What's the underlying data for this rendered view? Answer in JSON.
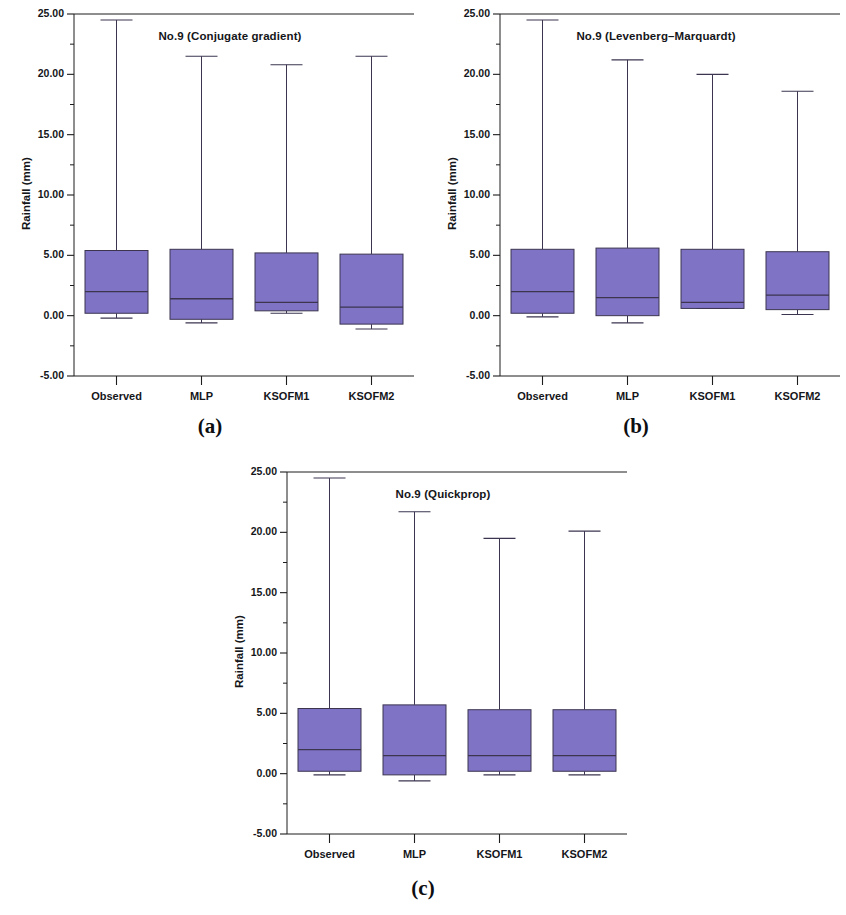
{
  "figure": {
    "panels": [
      {
        "id": "a",
        "caption": "(a)",
        "title": "No.9 (Conjugate gradient)",
        "ylabel": "Rainfall (mm)"
      },
      {
        "id": "b",
        "caption": "(b)",
        "title": "No.9 (Levenberg–Marquardt)",
        "ylabel": "Rainfall (mm)"
      },
      {
        "id": "c",
        "caption": "(c)",
        "title": "No.9 (Quickprop)",
        "ylabel": "Rainfall (mm)"
      }
    ]
  },
  "axis": {
    "ytick_labels": [
      "25.00",
      "20.00",
      "15.00",
      "10.00",
      "5.00",
      "0.00",
      "-5.00"
    ],
    "xtick_labels": [
      "Observed",
      "MLP",
      "KSOFM1",
      "KSOFM2"
    ]
  },
  "colors": {
    "box_fill": "#7f73c6",
    "box_edge": "#3d3550",
    "axis": "#1c1c1c",
    "text": "#15161a",
    "background": "#ffffff"
  },
  "chart_data": [
    {
      "type": "box",
      "panel": "a",
      "title": "No.9 (Conjugate gradient)",
      "xlabel": "",
      "ylabel": "Rainfall (mm)",
      "ylim": [
        -5.0,
        25.0
      ],
      "ytick_values": [
        25.0,
        20.0,
        15.0,
        10.0,
        5.0,
        0.0,
        -5.0
      ],
      "minor_tick_step": 2.5,
      "grid": false,
      "legend": "none",
      "categories": [
        "Observed",
        "MLP",
        "KSOFM1",
        "KSOFM2"
      ],
      "boxes": [
        {
          "category": "Observed",
          "whisker_low": -0.2,
          "q1": 0.2,
          "median": 2.0,
          "q3": 5.4,
          "whisker_high": 24.5
        },
        {
          "category": "MLP",
          "whisker_low": -0.6,
          "q1": -0.3,
          "median": 1.4,
          "q3": 5.5,
          "whisker_high": 21.5
        },
        {
          "category": "KSOFM1",
          "whisker_low": 0.2,
          "q1": 0.4,
          "median": 1.1,
          "q3": 5.2,
          "whisker_high": 20.8
        },
        {
          "category": "KSOFM2",
          "whisker_low": -1.1,
          "q1": -0.7,
          "median": 0.7,
          "q3": 5.1,
          "whisker_high": 21.5
        }
      ]
    },
    {
      "type": "box",
      "panel": "b",
      "title": "No.9 (Levenberg–Marquardt)",
      "xlabel": "",
      "ylabel": "Rainfall (mm)",
      "ylim": [
        -5.0,
        25.0
      ],
      "ytick_values": [
        25.0,
        20.0,
        15.0,
        10.0,
        5.0,
        0.0,
        -5.0
      ],
      "minor_tick_step": 2.5,
      "grid": false,
      "legend": "none",
      "categories": [
        "Observed",
        "MLP",
        "KSOFM1",
        "KSOFM2"
      ],
      "boxes": [
        {
          "category": "Observed",
          "whisker_low": -0.1,
          "q1": 0.2,
          "median": 2.0,
          "q3": 5.5,
          "whisker_high": 24.5
        },
        {
          "category": "MLP",
          "whisker_low": -0.6,
          "q1": 0.0,
          "median": 1.5,
          "q3": 5.6,
          "whisker_high": 21.2
        },
        {
          "category": "KSOFM1",
          "whisker_low": 0.6,
          "q1": 0.6,
          "median": 1.1,
          "q3": 5.5,
          "whisker_high": 20.0
        },
        {
          "category": "KSOFM2",
          "whisker_low": 0.1,
          "q1": 0.5,
          "median": 1.7,
          "q3": 5.3,
          "whisker_high": 18.6
        }
      ]
    },
    {
      "type": "box",
      "panel": "c",
      "title": "No.9 (Quickprop)",
      "xlabel": "",
      "ylabel": "Rainfall (mm)",
      "ylim": [
        -5.0,
        25.0
      ],
      "ytick_values": [
        25.0,
        20.0,
        15.0,
        10.0,
        5.0,
        0.0,
        -5.0
      ],
      "minor_tick_step": 2.5,
      "grid": false,
      "legend": "none",
      "categories": [
        "Observed",
        "MLP",
        "KSOFM1",
        "KSOFM2"
      ],
      "boxes": [
        {
          "category": "Observed",
          "whisker_low": -0.1,
          "q1": 0.2,
          "median": 2.0,
          "q3": 5.4,
          "whisker_high": 24.5
        },
        {
          "category": "MLP",
          "whisker_low": -0.6,
          "q1": -0.1,
          "median": 1.5,
          "q3": 5.7,
          "whisker_high": 21.7
        },
        {
          "category": "KSOFM1",
          "whisker_low": -0.1,
          "q1": 0.2,
          "median": 1.5,
          "q3": 5.3,
          "whisker_high": 19.5
        },
        {
          "category": "KSOFM2",
          "whisker_low": -0.1,
          "q1": 0.2,
          "median": 1.5,
          "q3": 5.3,
          "whisker_high": 20.1
        }
      ]
    }
  ]
}
